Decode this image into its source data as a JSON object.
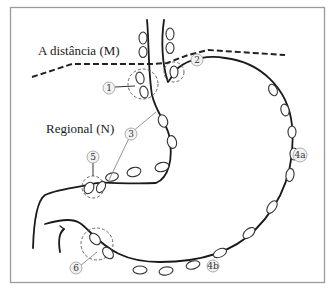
{
  "diagram": {
    "labels": {
      "distant": "A distância (M)",
      "regional": "Regional (N)"
    },
    "stations": [
      {
        "id": "1",
        "label": "1"
      },
      {
        "id": "2",
        "label": "2"
      },
      {
        "id": "3",
        "label": "3"
      },
      {
        "id": "4a",
        "label": "4a"
      },
      {
        "id": "4b",
        "label": "4b"
      },
      {
        "id": "5",
        "label": "5"
      },
      {
        "id": "6",
        "label": "6"
      }
    ],
    "colors": {
      "outline": "#1a1a1a",
      "frame": "#9a9a9a",
      "badge_fill": "#f2f2f2"
    }
  }
}
